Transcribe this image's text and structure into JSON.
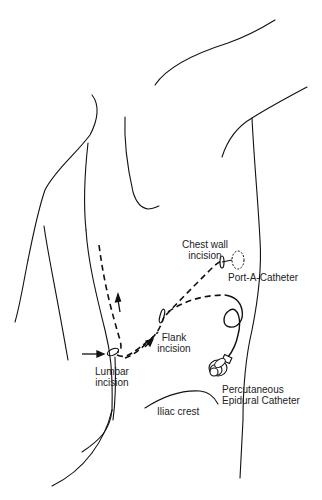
{
  "figure": {
    "labels": {
      "chest_wall_l1": "Chest wall",
      "chest_wall_l2": "incision",
      "port": "Port-A-Catheter",
      "flank_l1": "Flank",
      "flank_l2": "incision",
      "lumbar_l1": "Lumbar",
      "lumbar_l2": "incision",
      "epidural_l1": "Percutaneous",
      "epidural_l2": "Epidural Catheter",
      "iliac": "Iliac crest"
    },
    "colors": {
      "line": "#111111",
      "text": "#222222",
      "background": "#ffffff"
    }
  }
}
